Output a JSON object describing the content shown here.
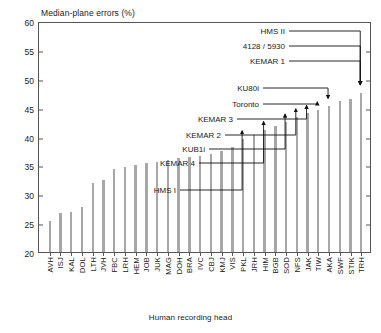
{
  "chart_data": {
    "type": "bar",
    "title": "",
    "ylabel": "Median-plane errors (%)",
    "xlabel": "Human recording head",
    "ylim": [
      20,
      60
    ],
    "yticks": [
      20,
      25,
      30,
      35,
      40,
      45,
      50,
      55,
      60
    ],
    "grid": false,
    "legend": null,
    "categories": [
      "AVH",
      "ISJ",
      "KAL",
      "DOL",
      "LTH",
      "JVH",
      "FBC",
      "LRH",
      "HEM",
      "JOB",
      "JUK",
      "MAG",
      "DOH",
      "BRA",
      "IVC",
      "CBJ",
      "KMJ",
      "VIS",
      "PKL",
      "JRH",
      "HIM",
      "BGB",
      "SOD",
      "NFS",
      "JAK",
      "TIW",
      "AKA",
      "SWF",
      "STIK",
      "TRH"
    ],
    "values": [
      25.4,
      26.7,
      26.9,
      27.8,
      31.9,
      32.4,
      34.4,
      34.8,
      35.1,
      35.4,
      35.6,
      36.0,
      36.2,
      36.4,
      36.6,
      36.9,
      37.5,
      38.2,
      39.6,
      40.2,
      41.2,
      41.8,
      42.5,
      43.4,
      44.0,
      44.6,
      45.2,
      46.2,
      46.5,
      47.6
    ],
    "annotations": [
      {
        "label": "HMS I",
        "target": "PKL"
      },
      {
        "label": "KEMAR 4",
        "target": "HIM"
      },
      {
        "label": "KUB1i",
        "target": "SOD"
      },
      {
        "label": "KEMAR 2",
        "target": "NFS"
      },
      {
        "label": "KEMAR 3",
        "target": "JAK"
      },
      {
        "label": "Toronto",
        "target": "TIW"
      },
      {
        "label": "KU80i",
        "target": "AKA"
      },
      {
        "label": "KEMAR 1",
        "target": "TRH"
      },
      {
        "label": "4128 / 5930",
        "target": "TRH"
      },
      {
        "label": "HMS II",
        "target": "TRH"
      }
    ],
    "colors": {
      "bar": "#a7a7a7",
      "axis": "#555555",
      "text": "#1a1a1a",
      "background": "#ffffff"
    }
  }
}
